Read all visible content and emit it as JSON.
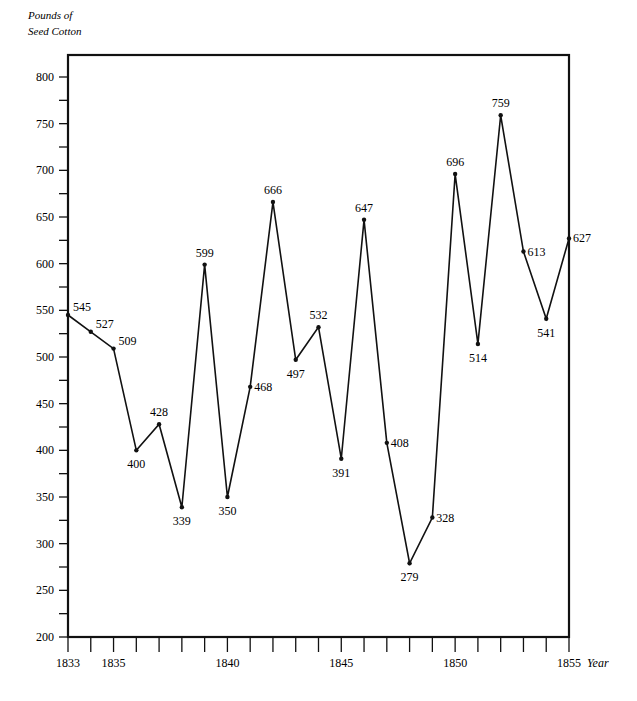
{
  "chart_data": {
    "type": "line",
    "title": "",
    "ylabel_lines": [
      "Pounds of",
      "Seed Cotton"
    ],
    "ylabel": "Pounds of Seed Cotton",
    "xlabel": "Year",
    "ylim": [
      200,
      800
    ],
    "xlim": [
      1833,
      1855
    ],
    "grid": false,
    "legend": null,
    "y_ticks": [
      200,
      250,
      300,
      350,
      400,
      450,
      500,
      550,
      600,
      650,
      700,
      750,
      800
    ],
    "x_tick_labels": [
      "1833",
      "1835",
      "1840",
      "1845",
      "1850",
      "1855"
    ],
    "x": [
      1833,
      1834,
      1835,
      1836,
      1837,
      1838,
      1839,
      1840,
      1841,
      1842,
      1843,
      1844,
      1845,
      1846,
      1847,
      1848,
      1849,
      1850,
      1851,
      1852,
      1853,
      1854,
      1855
    ],
    "values": [
      545,
      527,
      509,
      400,
      428,
      339,
      599,
      350,
      468,
      666,
      497,
      532,
      391,
      647,
      408,
      279,
      328,
      696,
      514,
      759,
      613,
      541,
      627
    ],
    "series": [
      {
        "name": "Pounds of Seed Cotton",
        "x": [
          1833,
          1834,
          1835,
          1836,
          1837,
          1838,
          1839,
          1840,
          1841,
          1842,
          1843,
          1844,
          1845,
          1846,
          1847,
          1848,
          1849,
          1850,
          1851,
          1852,
          1853,
          1854,
          1855
        ],
        "values": [
          545,
          527,
          509,
          400,
          428,
          339,
          599,
          350,
          468,
          666,
          497,
          532,
          391,
          647,
          408,
          279,
          328,
          696,
          514,
          759,
          613,
          541,
          627
        ]
      }
    ],
    "label_positions": [
      "ur",
      "ur",
      "ur",
      "below",
      "above",
      "below",
      "above",
      "below",
      "right",
      "above",
      "below",
      "above",
      "below",
      "above",
      "right",
      "below",
      "right",
      "above",
      "below",
      "above",
      "right",
      "below",
      "right"
    ]
  }
}
